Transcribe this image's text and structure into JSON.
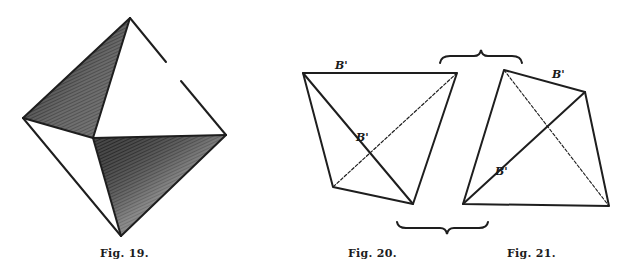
{
  "figures": [
    {
      "id": "fig19",
      "caption": "Fig. 19.",
      "description": "Octahedron with two shaded faces"
    },
    {
      "id": "fig20",
      "caption": "Fig. 20.",
      "labels": [
        "B'",
        "B'"
      ],
      "description": "Quadrilateral with solid and dashed diagonals"
    },
    {
      "id": "fig21",
      "caption": "Fig. 21.",
      "labels": [
        "B'",
        "B'"
      ],
      "description": "Quadrilateral with solid and dashed diagonals"
    }
  ],
  "colors": {
    "line": "#1e1e1e",
    "shade_dark": "#3a3a3a",
    "shade_light": "#8a8a8a",
    "background": "#ffffff"
  }
}
